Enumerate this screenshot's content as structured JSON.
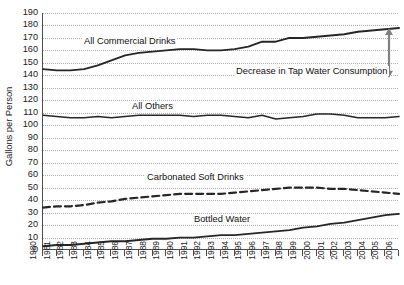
{
  "chart_data": {
    "type": "line",
    "title": "",
    "subtitle": "",
    "xlabel": "",
    "ylabel": "Gallons per Person",
    "xlim": [
      1980,
      2006
    ],
    "ylim": [
      0,
      190
    ],
    "ytick_step": 10,
    "grid": true,
    "legend_position": "inline-annotations",
    "x": [
      1980,
      1981,
      1982,
      1983,
      1984,
      1985,
      1986,
      1987,
      1988,
      1989,
      1990,
      1991,
      1992,
      1993,
      1994,
      1995,
      1996,
      1997,
      1998,
      1999,
      2000,
      2001,
      2002,
      2003,
      2004,
      2005,
      2006
    ],
    "ytick_labels": [
      "190",
      "180",
      "170",
      "160",
      "150",
      "140",
      "130",
      "120",
      "110",
      "100",
      "90",
      "80",
      "70",
      "60",
      "50",
      "40",
      "30",
      "20",
      "10",
      "0"
    ],
    "xtick_labels": [
      "1980",
      "1981",
      "1982",
      "1983",
      "1984",
      "1985",
      "1986",
      "1987",
      "1988",
      "1989",
      "1990",
      "1991",
      "1992",
      "1993",
      "1994",
      "1995",
      "1996",
      "1997",
      "1998",
      "1999",
      "2000",
      "2001",
      "2002",
      "2003",
      "2004",
      "2005",
      "2006"
    ],
    "series": [
      {
        "name": "All Commercial Drinks",
        "label": "All Commercial Drinks",
        "style": "solid",
        "color": "#262626",
        "width": 1.9,
        "values": [
          145,
          144,
          144,
          145,
          148,
          152,
          156,
          158,
          159,
          160,
          161,
          161,
          160,
          160,
          161,
          163,
          167,
          167,
          170,
          170,
          171,
          172,
          173,
          175,
          176,
          177,
          178
        ]
      },
      {
        "name": "All Others",
        "label": "All Others",
        "style": "solid",
        "color": "#262626",
        "width": 1.5,
        "values": [
          108,
          107,
          106,
          106,
          107,
          106,
          107,
          108,
          108,
          108,
          108,
          107,
          108,
          108,
          107,
          106,
          108,
          105,
          106,
          107,
          109,
          109,
          108,
          106,
          106,
          106,
          107
        ]
      },
      {
        "name": "Carbonated Soft Drinks",
        "label": "Carbonated Soft Drinks",
        "style": "dashed",
        "color": "#262626",
        "width": 2.2,
        "values": [
          34,
          35,
          35,
          36,
          38,
          39,
          41,
          42,
          43,
          44,
          45,
          45,
          45,
          45,
          46,
          47,
          48,
          49,
          50,
          50,
          50,
          49,
          49,
          48,
          47,
          46,
          45
        ]
      },
      {
        "name": "Bottled Water",
        "label": "Bottled Water",
        "style": "solid",
        "color": "#262626",
        "width": 1.8,
        "values": [
          3,
          4,
          4,
          5,
          6,
          7,
          7,
          8,
          9,
          9,
          10,
          10,
          11,
          12,
          12,
          13,
          14,
          15,
          16,
          18,
          19,
          21,
          22,
          24,
          26,
          28,
          29
        ]
      }
    ],
    "annotations": [
      {
        "name": "tap-water-decrease",
        "text": "Decrease in Tap Water Consumption",
        "marker": "double-headed-vertical-arrow",
        "arrow_top_value": 178,
        "arrow_bottom_value": 138
      }
    ]
  },
  "axes": {
    "y_title": "Gallons per Person"
  }
}
